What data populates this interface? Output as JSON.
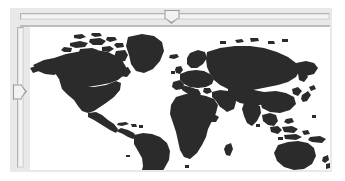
{
  "widget": {
    "name": "world-map-viewer",
    "title": "World Map",
    "frame_color": "#e9e9e9",
    "canvas_color": "#ffffff",
    "land_color": "#2b2b2b",
    "track_color": "#e4e4e4",
    "thumb_color": "#f2f2f2",
    "thumb_border_color": "#9a9a9a"
  },
  "controls": {
    "horizontal_slider": {
      "label": "Horizontal pan",
      "orientation": "horizontal",
      "min": 0,
      "max": 100,
      "value": 49,
      "thumb_shape": "pentagon-down",
      "track_left_px": 20,
      "track_width_px": 310
    },
    "vertical_slider": {
      "label": "Vertical pan",
      "orientation": "vertical",
      "min": 0,
      "max": 100,
      "value": 46,
      "thumb_shape": "pentagon-right",
      "track_top_px": 27,
      "track_height_px": 141
    }
  },
  "map": {
    "projection": "equirectangular",
    "view_box": "0 0 300 143",
    "landmasses": [
      "north-america",
      "greenland",
      "canadian-arctic-archipelago",
      "central-america",
      "caribbean",
      "south-america",
      "europe",
      "scandinavia",
      "british-isles",
      "iceland",
      "africa",
      "madagascar",
      "asia",
      "arabian-peninsula",
      "india",
      "southeast-asia",
      "indonesia",
      "japan",
      "australia",
      "new-zealand",
      "new-guinea"
    ]
  }
}
